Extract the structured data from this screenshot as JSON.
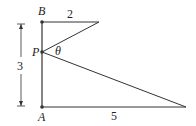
{
  "diagram": {
    "points": {
      "B": "B",
      "P": "P",
      "A": "A"
    },
    "angle_label": "θ",
    "lengths": {
      "top": "2",
      "bottom": "5",
      "height": "3"
    },
    "stroke_color": "#333333"
  }
}
